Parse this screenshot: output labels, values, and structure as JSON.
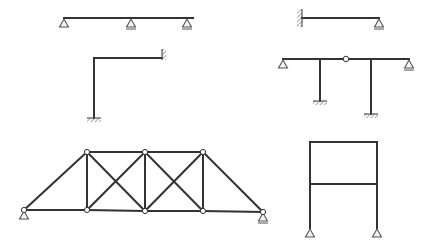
{
  "diagram": {
    "title": "",
    "stroke_color": "#333333",
    "support_color": "#555555",
    "support_fill": "#f2f2f2",
    "background": "#ffffff",
    "structures": [
      {
        "id": "continuous-beam",
        "type": "beam",
        "members": [
          [
            64,
            18,
            193,
            18
          ]
        ],
        "supports": [
          {
            "kind": "pin",
            "x": 64,
            "y": 18
          },
          {
            "kind": "roller",
            "x": 131,
            "y": 18
          },
          {
            "kind": "roller",
            "x": 187,
            "y": 18
          }
        ]
      },
      {
        "id": "propped-cantilever",
        "type": "beam",
        "members": [
          [
            302,
            18,
            379,
            18
          ]
        ],
        "supports": [
          {
            "kind": "fixed-wall-left",
            "x": 302,
            "y": 18
          },
          {
            "kind": "roller",
            "x": 379,
            "y": 18
          }
        ]
      },
      {
        "id": "l-frame",
        "type": "frame",
        "members": [
          [
            94,
            58,
            162,
            58
          ],
          [
            94,
            58,
            94,
            118
          ]
        ],
        "supports": [
          {
            "kind": "fixed-wall-right",
            "x": 162,
            "y": 58
          },
          {
            "kind": "fixed-ground",
            "x": 94,
            "y": 118
          }
        ]
      },
      {
        "id": "hinged-frame",
        "type": "frame",
        "members": [
          [
            283,
            59,
            409,
            59
          ],
          [
            320,
            59,
            320,
            101
          ],
          [
            371,
            59,
            371,
            114
          ]
        ],
        "hinges": [
          {
            "x": 346,
            "y": 59
          }
        ],
        "supports": [
          {
            "kind": "pin",
            "x": 283,
            "y": 59
          },
          {
            "kind": "roller",
            "x": 409,
            "y": 59
          },
          {
            "kind": "fixed-ground",
            "x": 320,
            "y": 101
          },
          {
            "kind": "fixed-ground",
            "x": 371,
            "y": 114
          }
        ]
      },
      {
        "id": "truss",
        "type": "truss",
        "nodes": [
          [
            24,
            210
          ],
          [
            87,
            210
          ],
          [
            145,
            211
          ],
          [
            203,
            211
          ],
          [
            263,
            212
          ],
          [
            87,
            152
          ],
          [
            145,
            152
          ],
          [
            203,
            152
          ]
        ],
        "members": [
          [
            0,
            1
          ],
          [
            1,
            2
          ],
          [
            2,
            3
          ],
          [
            3,
            4
          ],
          [
            5,
            6
          ],
          [
            6,
            7
          ],
          [
            0,
            5
          ],
          [
            7,
            4
          ],
          [
            5,
            1
          ],
          [
            6,
            2
          ],
          [
            7,
            3
          ],
          [
            5,
            2
          ],
          [
            1,
            6
          ],
          [
            6,
            3
          ],
          [
            2,
            7
          ]
        ],
        "supports": [
          {
            "kind": "pin",
            "x": 24,
            "y": 210
          },
          {
            "kind": "roller",
            "x": 263,
            "y": 212
          }
        ]
      },
      {
        "id": "portal-frame",
        "type": "frame",
        "members": [
          [
            310,
            142,
            377,
            142
          ],
          [
            310,
            184,
            377,
            184
          ],
          [
            310,
            142,
            310,
            228
          ],
          [
            377,
            142,
            377,
            228
          ]
        ],
        "supports": [
          {
            "kind": "pin",
            "x": 310,
            "y": 228
          },
          {
            "kind": "pin",
            "x": 377,
            "y": 228
          }
        ]
      }
    ]
  }
}
